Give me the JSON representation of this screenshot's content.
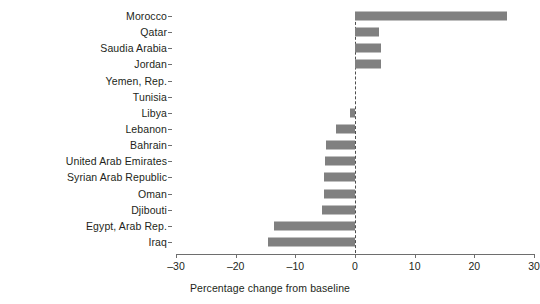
{
  "chart_data": {
    "type": "bar",
    "orientation": "horizontal",
    "title": "",
    "xlabel": "Percentage change from baseline",
    "ylabel": "",
    "xlim": [
      -30,
      30
    ],
    "xticks": [
      -30,
      -20,
      -10,
      0,
      10,
      20,
      30
    ],
    "xtick_labels": [
      "–30",
      "–20",
      "–10",
      "0",
      "10",
      "20",
      "30"
    ],
    "grid": false,
    "legend": null,
    "reference_line": {
      "value": 0,
      "style": "dashed",
      "color": "#4d4d4d"
    },
    "bar_color": "#808080",
    "categories": [
      "Morocco",
      "Qatar",
      "Saudia Arabia",
      "Jordan",
      "Yemen, Rep.",
      "Tunisia",
      "Libya",
      "Lebanon",
      "Bahrain",
      "United Arab Emirates",
      "Syrian Arab Republic",
      "Oman",
      "Djibouti",
      "Egypt, Arab Rep.",
      "Iraq"
    ],
    "values": [
      25.5,
      4.1,
      4.3,
      4.3,
      0,
      0,
      -0.9,
      -3.2,
      -4.9,
      -5.0,
      -5.2,
      -5.2,
      -5.6,
      -13.6,
      -14.6
    ]
  }
}
